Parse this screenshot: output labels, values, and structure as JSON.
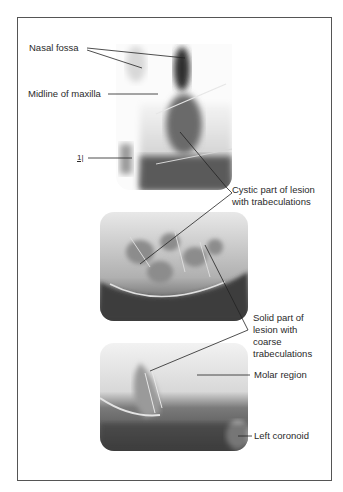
{
  "figure": {
    "labels": {
      "nasal_fossa": "Nasal fossa",
      "midline_maxilla": "Midline of maxilla",
      "tooth_marker": "1|",
      "cystic_line1": "Cystic part of lesion",
      "cystic_line2": "with trabeculations",
      "solid_line1": "Solid part of",
      "solid_line2": "lesion with",
      "solid_line3": "coarse",
      "solid_line4": "trabeculations",
      "molar_region": "Molar region",
      "left_coronoid": "Left coronoid"
    },
    "images": [
      {
        "name": "anterior-occlusal-radiograph"
      },
      {
        "name": "lateral-radiograph-cystic"
      },
      {
        "name": "lateral-radiograph-molar"
      }
    ],
    "colors": {
      "border": "#555555",
      "leader": "#222222",
      "text": "#2a2a2a"
    }
  }
}
